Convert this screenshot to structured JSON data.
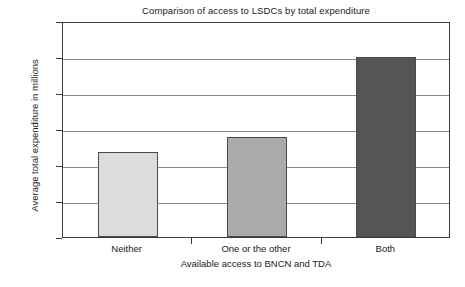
{
  "chart_data": {
    "type": "bar",
    "title": "Comparison of access to LSDCs by total expenditure",
    "xlabel": "Available access to BNCN and TDA",
    "ylabel": "Average total expenditure in millions",
    "categories": [
      "Neither",
      "One or the other",
      "Both"
    ],
    "values": [
      4.75,
      5.55,
      10.0
    ],
    "series": [
      {
        "name": "Average total expenditure in millions",
        "values": [
          4.75,
          5.55,
          10.0
        ]
      }
    ],
    "ylim": [
      0,
      12
    ],
    "ytick_values": [
      0,
      2,
      4,
      6,
      8,
      10,
      12
    ],
    "ytick_labels": [
      "£0",
      "£2",
      "£4",
      "£6",
      "£8",
      "£10",
      "£12"
    ],
    "grid": true,
    "legend": "none",
    "bar_colors": [
      "#dcdcdc",
      "#aaaaaa",
      "#555555"
    ],
    "bar_border_color": "#4a4a4a",
    "grid_color": "#8a8a8a",
    "axis_color": "#3c3c3c",
    "background": "#ffffff"
  }
}
